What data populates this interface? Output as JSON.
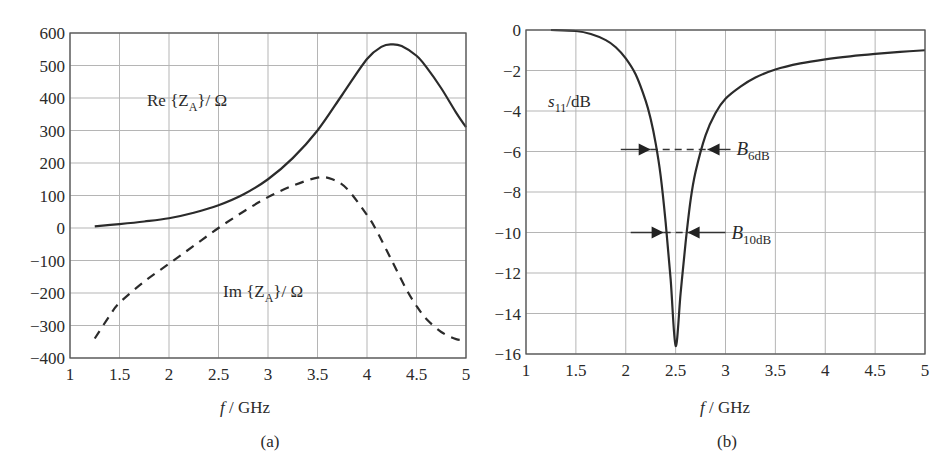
{
  "chart_data": [
    {
      "id": "a",
      "type": "line",
      "caption": "(a)",
      "title": "",
      "xlabel_italic": "f",
      "xlabel_rest": " / GHz",
      "ylabel": "",
      "xlim": [
        1,
        5
      ],
      "ylim": [
        -400,
        600
      ],
      "xticks": [
        1,
        1.5,
        2,
        2.5,
        3,
        3.5,
        4,
        4.5,
        5
      ],
      "xtick_labels": [
        "1",
        "1.5",
        "2",
        "2.5",
        "3",
        "3.5",
        "4",
        "4.5",
        "5"
      ],
      "yticks": [
        600,
        500,
        400,
        300,
        200,
        100,
        0,
        -100,
        -200,
        -300,
        -400
      ],
      "ytick_labels": [
        "600",
        "500",
        "400",
        "300",
        "200",
        "100",
        "0",
        "−100",
        "−200",
        "−300",
        "−400"
      ],
      "grid": true,
      "series": [
        {
          "name": "Re {Z_A} / Ω",
          "label_main": "Re {Z",
          "label_sub": "A",
          "label_tail": "}/ Ω",
          "style": "solid",
          "x": [
            1.25,
            1.5,
            1.75,
            2,
            2.25,
            2.5,
            2.75,
            3,
            3.25,
            3.5,
            3.75,
            4,
            4.15,
            4.25,
            4.35,
            4.5,
            4.6,
            4.75,
            4.9,
            5
          ],
          "y": [
            5,
            12,
            20,
            30,
            47,
            70,
            103,
            150,
            215,
            300,
            410,
            520,
            558,
            565,
            560,
            530,
            495,
            430,
            355,
            310
          ]
        },
        {
          "name": "Im {Z_A} / Ω",
          "label_main": "Im {Z",
          "label_sub": "A",
          "label_tail": "}/ Ω",
          "style": "dashed",
          "x": [
            1.25,
            1.4,
            1.5,
            1.75,
            2,
            2.25,
            2.5,
            2.75,
            3,
            3.25,
            3.5,
            3.65,
            3.8,
            4,
            4.1,
            4.25,
            4.4,
            4.5,
            4.6,
            4.75,
            4.9,
            5
          ],
          "y": [
            -340,
            -270,
            -230,
            -165,
            -110,
            -55,
            0,
            50,
            95,
            130,
            155,
            150,
            120,
            40,
            -10,
            -100,
            -190,
            -240,
            -280,
            -320,
            -342,
            -345
          ]
        }
      ]
    },
    {
      "id": "b",
      "type": "line",
      "caption": "(b)",
      "title": "",
      "xlabel_italic": "f",
      "xlabel_rest": " / GHz",
      "ylabel_main": "s",
      "ylabel_sub": "11",
      "ylabel_tail": "/dB",
      "ylabel": "s11 / dB",
      "xlim": [
        1,
        5
      ],
      "ylim": [
        -16,
        0
      ],
      "xticks": [
        1,
        1.5,
        2,
        2.5,
        3,
        3.5,
        4,
        4.5,
        5
      ],
      "xtick_labels": [
        "1",
        "1.5",
        "2",
        "2.5",
        "3",
        "3.5",
        "4",
        "4.5",
        "5"
      ],
      "yticks": [
        0,
        -2,
        -4,
        -6,
        -8,
        -10,
        -12,
        -14,
        -16
      ],
      "ytick_labels": [
        "0",
        "−2",
        "−4",
        "−6",
        "−8",
        "−10",
        "−12",
        "−14",
        "−16"
      ],
      "grid": true,
      "series": [
        {
          "name": "s11",
          "style": "solid",
          "x": [
            1.25,
            1.5,
            1.65,
            1.8,
            1.9,
            2,
            2.1,
            2.2,
            2.25,
            2.3,
            2.35,
            2.4,
            2.45,
            2.5,
            2.55,
            2.6,
            2.65,
            2.7,
            2.8,
            2.9,
            3,
            3.15,
            3.3,
            3.5,
            3.75,
            4,
            4.25,
            4.5,
            4.75,
            5
          ],
          "y": [
            0,
            -0.05,
            -0.2,
            -0.5,
            -0.85,
            -1.4,
            -2.2,
            -3.5,
            -4.4,
            -5.6,
            -7.2,
            -9.5,
            -12.3,
            -15.6,
            -13.0,
            -10.5,
            -8.4,
            -7.0,
            -5.2,
            -4.1,
            -3.4,
            -2.8,
            -2.35,
            -1.95,
            -1.65,
            -1.45,
            -1.3,
            -1.18,
            -1.08,
            -1.0
          ]
        }
      ],
      "annotations": [
        {
          "name": "B_6dB",
          "label_main": "B",
          "label_sub": "6dB",
          "y": -5.9,
          "x_left": 2.25,
          "x_right": 2.82,
          "line_from": 1.95,
          "line_to": 3.05
        },
        {
          "name": "B_10dB",
          "label_main": "B",
          "label_sub": "10dB",
          "y": -10,
          "x_left": 2.38,
          "x_right": 2.62,
          "line_from": 2.05,
          "line_to": 3.0
        }
      ]
    }
  ]
}
